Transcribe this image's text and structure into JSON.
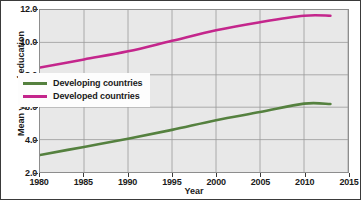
{
  "chart_data": {
    "type": "line",
    "title": "",
    "xlabel": "Year",
    "ylabel": "Mean years of education",
    "xlim": [
      1980,
      2015
    ],
    "ylim": [
      2.0,
      12.0
    ],
    "grid": true,
    "legend_position": "center-left",
    "xticks": [
      1980,
      1985,
      1990,
      1995,
      2000,
      2005,
      2010,
      2015
    ],
    "xtick_labels": [
      "1980",
      "1985",
      "1990",
      "1995",
      "2000",
      "2005",
      "2010",
      "2015"
    ],
    "yticks": [
      2.0,
      4.0,
      6.0,
      8.0,
      10.0,
      12.0
    ],
    "ytick_labels": [
      "2.0",
      "4.0",
      "6.0",
      "8.0",
      "10.0",
      "12.0"
    ],
    "series": [
      {
        "name": "Developing countries",
        "color": "#55813f",
        "x": [
          1980,
          1985,
          1990,
          1995,
          2000,
          2005,
          2010,
          2013
        ],
        "values": [
          3.05,
          3.55,
          4.05,
          4.6,
          5.2,
          5.7,
          6.22,
          6.2
        ]
      },
      {
        "name": "Developed countries",
        "color": "#c4268c",
        "x": [
          1980,
          1985,
          1990,
          1995,
          2000,
          2005,
          2010,
          2013
        ],
        "values": [
          8.45,
          8.95,
          9.45,
          10.1,
          10.75,
          11.25,
          11.65,
          11.65
        ]
      }
    ]
  },
  "legend": {
    "entries": [
      {
        "label": "Developing countries",
        "color": "#55813f"
      },
      {
        "label": "Developed countries",
        "color": "#c4268c"
      }
    ]
  },
  "axes": {
    "x_title": "Year",
    "y_title": "Mean years of education"
  },
  "colors": {
    "plot_background": "#e8e8e8",
    "figure_background": "#ffffff",
    "gridline": "#9a9a9a",
    "frame": "#8d8d8d",
    "text": "#1a1a1a",
    "series_developing": "#55813f",
    "series_developed": "#c4268c"
  }
}
